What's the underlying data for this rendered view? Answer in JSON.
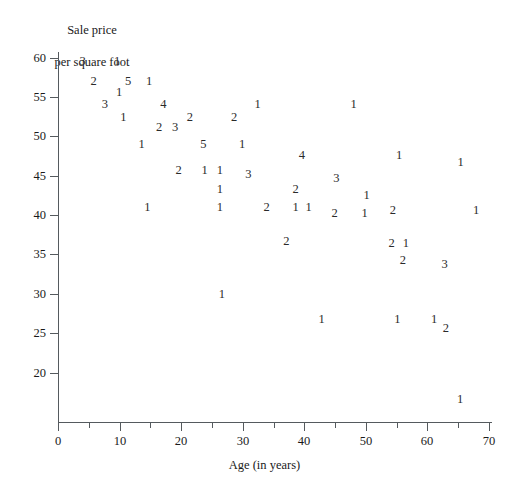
{
  "chart_data": {
    "type": "scatter",
    "title": "",
    "ylabel": "Sale price\nper square foot",
    "ylabel_lines": [
      "Sale price",
      "per square foot"
    ],
    "xlabel": "Age (in years)",
    "xlim": [
      0,
      70
    ],
    "ylim": [
      16,
      61
    ],
    "grid": false,
    "legend": null,
    "point_marker": "count-digit",
    "marker_note": "Each plotted glyph is the number of observations at that location",
    "xticks": [
      0,
      10,
      20,
      30,
      40,
      50,
      60,
      70
    ],
    "xtick_labels": [
      "0",
      "10",
      "20",
      "30",
      "40",
      "50",
      "60",
      "70"
    ],
    "xminor_ticks": [
      5,
      15,
      25,
      35,
      45,
      55,
      65
    ],
    "yticks": [
      20,
      25,
      30,
      35,
      40,
      45,
      50,
      55,
      60
    ],
    "ytick_labels": [
      "20",
      "25",
      "30",
      "35",
      "40",
      "45",
      "50",
      "55",
      "60"
    ],
    "points": [
      {
        "x": 4.0,
        "y": 59.6,
        "count": "3"
      },
      {
        "x": 9.6,
        "y": 59.6,
        "count": "1"
      },
      {
        "x": 5.8,
        "y": 57.0,
        "count": "2"
      },
      {
        "x": 11.4,
        "y": 57.0,
        "count": "5"
      },
      {
        "x": 14.8,
        "y": 57.0,
        "count": "1"
      },
      {
        "x": 9.9,
        "y": 55.6,
        "count": "1"
      },
      {
        "x": 7.6,
        "y": 54.1,
        "count": "3"
      },
      {
        "x": 17.1,
        "y": 54.1,
        "count": "4"
      },
      {
        "x": 32.4,
        "y": 54.1,
        "count": "1"
      },
      {
        "x": 48.0,
        "y": 54.1,
        "count": "1"
      },
      {
        "x": 10.6,
        "y": 52.5,
        "count": "1"
      },
      {
        "x": 21.4,
        "y": 52.5,
        "count": "2"
      },
      {
        "x": 28.6,
        "y": 52.5,
        "count": "2"
      },
      {
        "x": 16.4,
        "y": 51.2,
        "count": "2"
      },
      {
        "x": 19.0,
        "y": 51.2,
        "count": "3"
      },
      {
        "x": 13.6,
        "y": 49.0,
        "count": "1"
      },
      {
        "x": 23.6,
        "y": 49.0,
        "count": "5"
      },
      {
        "x": 29.9,
        "y": 49.0,
        "count": "1"
      },
      {
        "x": 39.6,
        "y": 47.6,
        "count": "4"
      },
      {
        "x": 55.4,
        "y": 47.6,
        "count": "1"
      },
      {
        "x": 65.4,
        "y": 46.7,
        "count": "1"
      },
      {
        "x": 19.6,
        "y": 45.7,
        "count": "2"
      },
      {
        "x": 23.8,
        "y": 45.7,
        "count": "1"
      },
      {
        "x": 26.3,
        "y": 45.7,
        "count": "1"
      },
      {
        "x": 30.9,
        "y": 45.2,
        "count": "3"
      },
      {
        "x": 45.2,
        "y": 44.7,
        "count": "3"
      },
      {
        "x": 26.3,
        "y": 43.3,
        "count": "1"
      },
      {
        "x": 38.6,
        "y": 43.3,
        "count": "2"
      },
      {
        "x": 50.1,
        "y": 42.5,
        "count": "1"
      },
      {
        "x": 14.5,
        "y": 41.0,
        "count": "1"
      },
      {
        "x": 26.3,
        "y": 41.0,
        "count": "1"
      },
      {
        "x": 33.9,
        "y": 41.0,
        "count": "2"
      },
      {
        "x": 38.6,
        "y": 41.0,
        "count": "1"
      },
      {
        "x": 40.7,
        "y": 41.0,
        "count": "1"
      },
      {
        "x": 44.9,
        "y": 40.3,
        "count": "2"
      },
      {
        "x": 49.8,
        "y": 40.3,
        "count": "1"
      },
      {
        "x": 54.4,
        "y": 40.6,
        "count": "2"
      },
      {
        "x": 67.9,
        "y": 40.6,
        "count": "1"
      },
      {
        "x": 37.1,
        "y": 36.7,
        "count": "2"
      },
      {
        "x": 54.2,
        "y": 36.5,
        "count": "2"
      },
      {
        "x": 56.5,
        "y": 36.5,
        "count": "1"
      },
      {
        "x": 56.0,
        "y": 34.3,
        "count": "2"
      },
      {
        "x": 62.8,
        "y": 33.8,
        "count": "3"
      },
      {
        "x": 26.6,
        "y": 30.0,
        "count": "1"
      },
      {
        "x": 42.8,
        "y": 26.8,
        "count": "1"
      },
      {
        "x": 55.1,
        "y": 26.8,
        "count": "1"
      },
      {
        "x": 61.1,
        "y": 26.8,
        "count": "1"
      },
      {
        "x": 63.0,
        "y": 25.6,
        "count": "2"
      },
      {
        "x": 65.3,
        "y": 16.7,
        "count": "1"
      }
    ]
  },
  "axes": {
    "y_title_lines": [
      "Sale price",
      "per square foot"
    ],
    "x_title": "Age (in years)"
  },
  "colors": {
    "axis": "#555a5e",
    "text": "#1a1a1a",
    "point": "#2a2a2a",
    "background": "#ffffff"
  }
}
